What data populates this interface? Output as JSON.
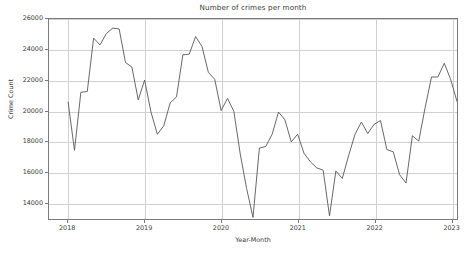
{
  "chart_data": {
    "type": "line",
    "title": "Number of crimes per month",
    "xlabel": "Year-Month",
    "ylabel": "Crime Count",
    "grid": true,
    "legend": false,
    "line_color": "#555555",
    "background_color": "#ffffff",
    "grid_color": "#d0d0d0",
    "axis_color": "#7a7a7a",
    "ylim": [
      12900,
      26000
    ],
    "yticks": [
      14000,
      16000,
      18000,
      20000,
      22000,
      24000,
      26000
    ],
    "ytick_labels": [
      "14000",
      "16000",
      "18000",
      "20000",
      "22000",
      "24000",
      "26000"
    ],
    "xlim": [
      "2017-10",
      "2023-02"
    ],
    "xticks": [
      "2018",
      "2019",
      "2020",
      "2021",
      "2022",
      "2023"
    ],
    "xtick_labels": [
      "2018",
      "2019",
      "2020",
      "2021",
      "2022",
      "2023"
    ],
    "x": [
      "2018-01",
      "2018-02",
      "2018-03",
      "2018-04",
      "2018-05",
      "2018-06",
      "2018-07",
      "2018-08",
      "2018-09",
      "2018-10",
      "2018-11",
      "2018-12",
      "2019-01",
      "2019-02",
      "2019-03",
      "2019-04",
      "2019-05",
      "2019-06",
      "2019-07",
      "2019-08",
      "2019-09",
      "2019-10",
      "2019-11",
      "2019-12",
      "2020-01",
      "2020-02",
      "2020-03",
      "2020-04",
      "2020-05",
      "2020-06",
      "2020-07",
      "2020-08",
      "2020-09",
      "2020-10",
      "2020-11",
      "2020-12",
      "2021-01",
      "2021-02",
      "2021-03",
      "2021-04",
      "2021-05",
      "2021-06",
      "2021-07",
      "2021-08",
      "2021-09",
      "2021-10",
      "2021-11",
      "2021-12",
      "2022-01",
      "2022-02",
      "2022-03",
      "2022-04",
      "2022-05",
      "2022-06",
      "2022-07",
      "2022-08",
      "2022-09",
      "2022-10",
      "2022-11"
    ],
    "values": [
      20550,
      17400,
      21200,
      21250,
      24750,
      24300,
      25050,
      25400,
      25350,
      23150,
      22850,
      20700,
      22000,
      19900,
      18450,
      19000,
      20500,
      20900,
      23650,
      23700,
      24850,
      24200,
      22500,
      22050,
      20000,
      20800,
      19950,
      17150,
      14900,
      13000,
      17550,
      17650,
      18450,
      19900,
      19400,
      17950,
      18450,
      17200,
      16650,
      16250,
      16100,
      13100,
      16050,
      15550,
      17050,
      18450,
      19250,
      18500,
      19100,
      19350,
      17450,
      17300,
      15800,
      15250,
      18350,
      18000,
      20200,
      22200,
      22200
    ],
    "series_name": "Crime Count",
    "notes": {
      "max_value": 25400,
      "min_value": 13000,
      "first_value": 20550,
      "last_value": 19700
    },
    "values_extended_tail": [
      23100,
      22050,
      20600,
      19700
    ]
  }
}
